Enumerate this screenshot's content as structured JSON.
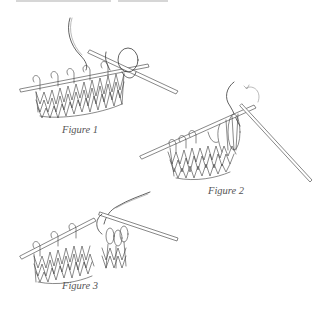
{
  "page": {
    "clipped_top_text": ""
  },
  "figures": [
    {
      "id": 1,
      "caption": "Figure 1"
    },
    {
      "id": 2,
      "caption": "Figure 2"
    },
    {
      "id": 3,
      "caption": "Figure 3"
    }
  ],
  "style": {
    "line_color": "#3a3a3a",
    "caption_color": "#555555",
    "background": "#ffffff"
  }
}
